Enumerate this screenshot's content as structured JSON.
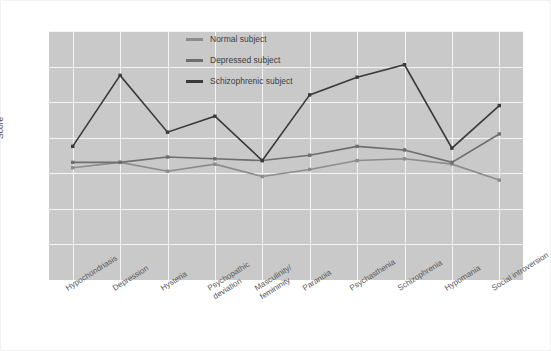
{
  "chart_data": {
    "type": "line",
    "title": "",
    "subtitle": "",
    "xlabel": "",
    "ylabel": "Score",
    "ylim": [
      0,
      90
    ],
    "y_ticks": [
      0,
      30,
      40,
      50,
      60,
      70,
      80,
      90
    ],
    "y_axis_broken": true,
    "grid": true,
    "legend_position": "inside-top-center",
    "plot_background": "#c9c9c9",
    "grid_color": "#f4f4f4",
    "categories": [
      "Hypochondriasis",
      "Depression",
      "Hysteria",
      "Psychopathic deviation",
      "Masculinity/femininity",
      "Paranoia",
      "Psychasthenia",
      "Schizophrenia",
      "Hypomania",
      "Social introversion"
    ],
    "category_lines": [
      [
        "Hypochondriasis"
      ],
      [
        "Depression"
      ],
      [
        "Hysteria"
      ],
      [
        "Psychopathic",
        "deviation"
      ],
      [
        "Masculinity/",
        "femininity"
      ],
      [
        "Paranoia"
      ],
      [
        "Psychasthenia"
      ],
      [
        "Schizophrenia"
      ],
      [
        "Hypomania"
      ],
      [
        "Social introversion"
      ]
    ],
    "series": [
      {
        "name": "Normal subject",
        "color": "#8c8c8c",
        "values": [
          51.5,
          53,
          50.5,
          52.5,
          49,
          51,
          53.5,
          54,
          52.5,
          48
        ]
      },
      {
        "name": "Depressed subject",
        "color": "#6e6e6e",
        "values": [
          53,
          53,
          54.5,
          54,
          53.5,
          55,
          57.5,
          56.5,
          53,
          61
        ]
      },
      {
        "name": "Schizophrenic subject",
        "color": "#3a3a3a",
        "values": [
          57.5,
          77.5,
          61.5,
          66,
          53.5,
          72,
          77,
          80.5,
          57,
          69
        ]
      }
    ]
  },
  "legend": {
    "items": [
      {
        "label": "Normal subject",
        "color": "#8c8c8c"
      },
      {
        "label": "Depressed subject",
        "color": "#6e6e6e"
      },
      {
        "label": "Schizophrenic subject",
        "color": "#3a3a3a"
      }
    ]
  },
  "axis": {
    "y_title": "Score"
  }
}
